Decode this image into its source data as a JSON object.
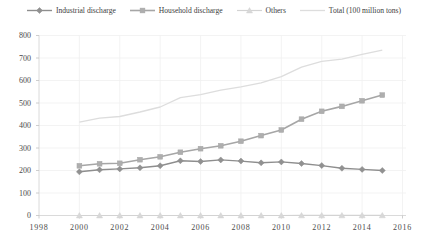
{
  "chart_title": "",
  "colors": {
    "grid": "#f0f0f0",
    "axis": "#d6d6d6",
    "tick": "#c2c2c2",
    "label_text": "#4a4a4a",
    "legend_text": "#3d3d3d",
    "background": "#ffffff"
  },
  "chart_data": {
    "type": "line",
    "x": [
      2000,
      2001,
      2002,
      2003,
      2004,
      2005,
      2006,
      2007,
      2008,
      2009,
      2010,
      2011,
      2012,
      2013,
      2014,
      2015
    ],
    "series": [
      {
        "name": "Industrial discharge",
        "marker": "diamond",
        "color": "#8e8e8e",
        "marker_fill": "#919191",
        "line_width": 1.4,
        "values": [
          194,
          203,
          207,
          212,
          221,
          243,
          240,
          247,
          242,
          234,
          238,
          231,
          222,
          210,
          205,
          200
        ]
      },
      {
        "name": "Household discharge",
        "marker": "square",
        "color": "#a6a6a6",
        "marker_fill": "#aeaeae",
        "line_width": 1.6,
        "values": [
          221,
          230,
          232,
          248,
          261,
          281,
          297,
          310,
          330,
          355,
          380,
          428,
          463,
          485,
          510,
          535
        ]
      },
      {
        "name": "Others",
        "marker": "triangle",
        "color": "#d3d3d3",
        "marker_fill": "#d8d8d8",
        "line_width": 1.2,
        "values": [
          0.1,
          0.1,
          0.1,
          0.1,
          0.1,
          0.1,
          0.1,
          0.1,
          0.1,
          0.1,
          0.1,
          0.4,
          0.5,
          0.5,
          0.6,
          0.6
        ]
      },
      {
        "name": "Total (100 million tons)",
        "marker": "none",
        "color": "#dddddd",
        "marker_fill": "#dddddd",
        "line_width": 1.3,
        "values": [
          415,
          433,
          440,
          460,
          482,
          524,
          537,
          557,
          572,
          590,
          617,
          659,
          685,
          695,
          716,
          735
        ]
      }
    ],
    "xlabel": "",
    "ylabel": "",
    "xlim": [
      1998,
      2016
    ],
    "ylim": [
      0,
      800
    ],
    "x_ticks": [
      1998,
      2000,
      2002,
      2004,
      2006,
      2008,
      2010,
      2012,
      2014,
      2016
    ],
    "y_ticks": [
      0,
      100,
      200,
      300,
      400,
      500,
      600,
      700,
      800
    ],
    "grid": true,
    "legend_position": "top"
  }
}
